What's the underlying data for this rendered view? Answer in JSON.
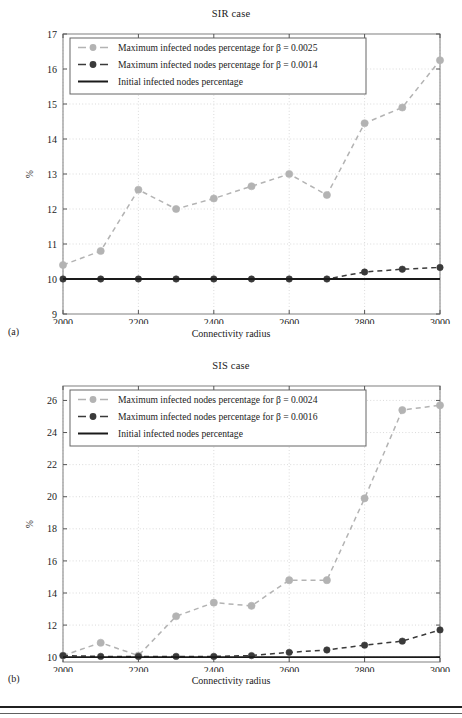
{
  "figures": [
    {
      "id": "a",
      "subfigure_label": "(a)",
      "title": "SIR case",
      "xlabel": "Connectivity radius",
      "ylabel": "%",
      "chart_data": {
        "type": "line",
        "title": "SIR case",
        "xlabel": "Connectivity radius",
        "ylabel": "%",
        "xlim": [
          2000,
          3000
        ],
        "ylim": [
          9,
          17
        ],
        "xticks": [
          2000,
          2200,
          2400,
          2600,
          2800,
          3000
        ],
        "ytick_labels": [
          "9",
          "10",
          "11",
          "12",
          "13",
          "14",
          "15",
          "16",
          "17"
        ],
        "yticks": [
          9,
          10,
          11,
          12,
          13,
          14,
          15,
          16,
          17
        ],
        "grid": true,
        "legend_position": "upper-left",
        "x": [
          2000,
          2100,
          2200,
          2300,
          2400,
          2500,
          2600,
          2700,
          2800,
          2900,
          3000
        ],
        "series": [
          {
            "name": "Maximum infected nodes percentage for β = 0.0025",
            "color": "#b3b3b3",
            "style": "dashed-marker",
            "values": [
              10.4,
              10.8,
              12.55,
              12.0,
              12.3,
              12.65,
              13.0,
              12.4,
              14.45,
              14.9,
              16.25
            ]
          },
          {
            "name": "Maximum infected nodes percentage for β = 0.0014",
            "color": "#3a3a3a",
            "style": "dashed-marker",
            "values": [
              10.0,
              10.0,
              10.0,
              10.0,
              10.0,
              10.0,
              10.0,
              10.0,
              10.2,
              10.28,
              10.33
            ]
          },
          {
            "name": "Initial infected nodes percentage",
            "color": "#1a1a1a",
            "style": "solid",
            "values": [
              10.0,
              10.0,
              10.0,
              10.0,
              10.0,
              10.0,
              10.0,
              10.0,
              10.0,
              10.0,
              10.0
            ]
          }
        ]
      }
    },
    {
      "id": "b",
      "subfigure_label": "(b)",
      "title": "SIS case",
      "xlabel": "Connectivity radius",
      "ylabel": "%",
      "chart_data": {
        "type": "line",
        "title": "SIS case",
        "xlabel": "Connectivity radius",
        "ylabel": "%",
        "xlim": [
          2000,
          3000
        ],
        "ylim": [
          9.7,
          26.9
        ],
        "xticks": [
          2000,
          2200,
          2400,
          2600,
          2800,
          3000
        ],
        "ytick_labels": [
          "10",
          "12",
          "14",
          "16",
          "18",
          "20",
          "22",
          "24",
          "26"
        ],
        "yticks": [
          10,
          12,
          14,
          16,
          18,
          20,
          22,
          24,
          26
        ],
        "grid": true,
        "legend_position": "upper-left",
        "x": [
          2000,
          2100,
          2200,
          2300,
          2400,
          2500,
          2600,
          2700,
          2800,
          2900,
          3000
        ],
        "series": [
          {
            "name": "Maximum infected nodes percentage for β = 0.0024",
            "color": "#b3b3b3",
            "style": "dashed-marker",
            "values": [
              10.1,
              10.9,
              10.1,
              12.55,
              13.4,
              13.2,
              14.8,
              14.8,
              19.9,
              25.4,
              25.7
            ]
          },
          {
            "name": "Maximum infected nodes percentage for β = 0.0016",
            "color": "#3a3a3a",
            "style": "dashed-marker",
            "values": [
              10.1,
              10.05,
              10.05,
              10.05,
              10.05,
              10.1,
              10.3,
              10.45,
              10.75,
              11.0,
              11.7
            ]
          },
          {
            "name": "Initial infected nodes percentage",
            "color": "#1a1a1a",
            "style": "solid",
            "values": [
              10.0,
              10.0,
              10.0,
              10.0,
              10.0,
              10.0,
              10.0,
              10.0,
              10.0,
              10.0,
              10.0
            ]
          }
        ]
      }
    }
  ]
}
